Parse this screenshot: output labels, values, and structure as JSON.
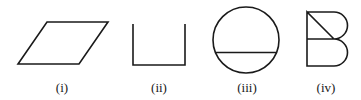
{
  "figures": [
    {
      "id": "i",
      "shape": "parallelogram",
      "label": "(i)",
      "label_x": 62
    },
    {
      "id": "ii",
      "shape": "open-rectangle-u",
      "label": "(ii)",
      "label_x": 159
    },
    {
      "id": "iii",
      "shape": "circle-with-chord",
      "label": "(iii)",
      "label_x": 247
    },
    {
      "id": "iv",
      "shape": "letter-b-outline",
      "label": "(iv)",
      "label_x": 326
    }
  ],
  "colors": {
    "stroke": "#1a1a1a",
    "background": "#ffffff"
  }
}
